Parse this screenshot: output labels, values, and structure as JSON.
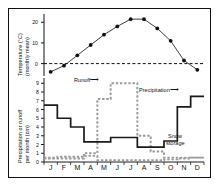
{
  "figure": {
    "top_axis_title_line1": "Temperature (°C)",
    "top_axis_title_line2": "(monthly mean)",
    "bottom_axis_title_line1": "Precipitation or runoff",
    "bottom_axis_title_line2": "per month (cm)"
  },
  "annotations": {
    "runoff": "Runoff",
    "precipitation": "Precipitation",
    "snow_storage_line1": "Snow",
    "snow_storage_line2": "storage"
  },
  "colors": {
    "precipitation": "#1a1a1a",
    "runoff": "#9a9a9a",
    "snow_storage": "#9a9a9a",
    "temperature": "#111111",
    "zero_line": "#111111",
    "frame": "#111111"
  },
  "axes": {
    "temperature_ticks": [
      "20",
      "10",
      "0"
    ],
    "temperature_tick_values": [
      20,
      10,
      0
    ],
    "temperature_range": [
      -6,
      24
    ],
    "precipitation_ticks": [
      "9",
      "8",
      "7",
      "6",
      "5",
      "4",
      "3",
      "2",
      "1",
      "0"
    ],
    "precipitation_tick_values": [
      9,
      8,
      7,
      6,
      5,
      4,
      3,
      2,
      1,
      0
    ],
    "precipitation_range": [
      0,
      9.6
    ],
    "month_labels": [
      "J",
      "F",
      "M",
      "A",
      "M",
      "J",
      "J",
      "A",
      "S",
      "O",
      "N",
      "D"
    ]
  },
  "chart_data": [
    {
      "type": "line",
      "title": "Temperature (monthly mean)",
      "xlabel": "",
      "ylabel": "Temperature (°C)",
      "categories": [
        "J",
        "F",
        "M",
        "A",
        "M",
        "J",
        "J",
        "A",
        "S",
        "O",
        "N",
        "D"
      ],
      "values": [
        -4,
        -1,
        4,
        9,
        14,
        18,
        21.5,
        21.5,
        17,
        11,
        1.5,
        -3
      ],
      "ylim": [
        -6,
        24
      ],
      "yticks": [
        0,
        10,
        20
      ],
      "grid": false,
      "legend": "none",
      "marker": "filled-circle",
      "annotations": [
        {
          "text": "0 °C reference",
          "type": "horizontal-dashed-line",
          "y": 0
        }
      ]
    },
    {
      "type": "area",
      "title": "Precipitation, runoff and snow storage",
      "xlabel": "",
      "ylabel": "Precipitation or runoff per month (cm)",
      "categories": [
        "J",
        "F",
        "M",
        "A",
        "M",
        "J",
        "J",
        "A",
        "S",
        "O",
        "N",
        "D"
      ],
      "ylim": [
        0,
        9.6
      ],
      "yticks": [
        0,
        1,
        2,
        3,
        4,
        5,
        6,
        7,
        8,
        9
      ],
      "grid": false,
      "legend": "inline-annotations",
      "series": [
        {
          "name": "Precipitation",
          "style": "solid-step",
          "values": [
            6.5,
            5.0,
            4.0,
            2.3,
            2.3,
            2.8,
            2.8,
            1.7,
            1.7,
            2.4,
            6.3,
            7.5
          ]
        },
        {
          "name": "Runoff",
          "style": "dashed-step",
          "values": [
            0.4,
            0.4,
            0.4,
            1.0,
            7.2,
            9.0,
            9.0,
            3.0,
            1.2,
            0.5,
            0.5,
            0.5
          ]
        },
        {
          "name": "Snow storage",
          "style": "dashed-step",
          "values": [
            0.5,
            0.6,
            0.6,
            0.7,
            0.2,
            0.2,
            0.2,
            0.2,
            0.2,
            0.3,
            0.4,
            0.5
          ]
        }
      ]
    }
  ]
}
